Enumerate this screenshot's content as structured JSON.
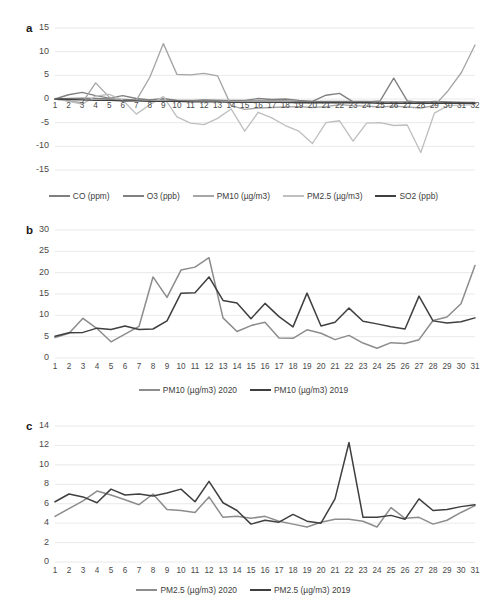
{
  "figure": {
    "width": 487,
    "height": 615,
    "background": "#ffffff"
  },
  "colors": {
    "co": "#7f7f7f",
    "o3": "#808080",
    "pm10": "#a6a6a6",
    "pm25": "#bfbfbf",
    "so2": "#404040",
    "series_2020": "#8c8c8c",
    "series_2019": "#3f3f3f",
    "gridline": "#e3e3e3",
    "text": "#404040"
  },
  "panels": {
    "a": {
      "letter": "a",
      "legend": [
        {
          "label": "CO (ppm)",
          "color": "#7f7f7f"
        },
        {
          "label": "O3 (ppb)",
          "color": "#808080"
        },
        {
          "label": "PM10 (µg/m3)",
          "color": "#a6a6a6"
        },
        {
          "label": "PM2.5 (µg/m3)",
          "color": "#bfbfbf"
        },
        {
          "label": "SO2 (ppb)",
          "color": "#404040"
        }
      ]
    },
    "b": {
      "letter": "b",
      "legend": [
        {
          "label": "PM10 (µg/m3) 2020",
          "color": "#8c8c8c"
        },
        {
          "label": "PM10 (µg/m3) 2019",
          "color": "#3f3f3f"
        }
      ]
    },
    "c": {
      "letter": "c",
      "legend": [
        {
          "label": "PM2.5 (µg/m3) 2020",
          "color": "#8c8c8c"
        },
        {
          "label": "PM2.5 (µg/m3) 2019",
          "color": "#3f3f3f"
        }
      ]
    }
  },
  "chart_data": [
    {
      "panel": "a",
      "type": "line",
      "title": "",
      "xlabel": "",
      "ylabel": "",
      "xlim": [
        1,
        32
      ],
      "ylim": [
        -15,
        15
      ],
      "yticks": [
        15,
        10,
        5,
        0,
        -5,
        -10,
        -15
      ],
      "xticks": [
        1,
        2,
        3,
        4,
        5,
        6,
        7,
        8,
        9,
        10,
        11,
        12,
        13,
        14,
        15,
        16,
        17,
        18,
        19,
        20,
        21,
        22,
        23,
        24,
        25,
        26,
        27,
        28,
        29,
        30,
        31,
        32
      ],
      "grid": true,
      "legend_position": "bottom",
      "x": [
        1,
        2,
        3,
        4,
        5,
        6,
        7,
        8,
        9,
        10,
        11,
        12,
        13,
        14,
        15,
        16,
        17,
        18,
        19,
        20,
        21,
        22,
        23,
        24,
        25,
        26,
        27,
        28,
        29,
        30,
        31,
        32
      ],
      "series": [
        {
          "name": "CO (ppm)",
          "color": "#7f7f7f",
          "values": [
            0.0,
            0.1,
            0.2,
            0.1,
            0.0,
            -0.1,
            -0.2,
            -0.2,
            -0.2,
            -0.3,
            -0.3,
            -0.3,
            -0.3,
            -0.4,
            -0.4,
            -0.4,
            -0.4,
            -0.4,
            -0.5,
            -0.5,
            -0.5,
            -0.5,
            -0.5,
            -0.5,
            -0.6,
            -0.6,
            -0.6,
            -0.6,
            -0.6,
            -0.7,
            -0.7,
            -0.7
          ]
        },
        {
          "name": "O3 (ppb)",
          "color": "#808080",
          "values": [
            0.0,
            0.9,
            1.4,
            0.7,
            0.2,
            0.7,
            0.1,
            -0.2,
            0.1,
            -0.3,
            -0.4,
            -0.2,
            -0.3,
            -0.3,
            -0.3,
            0.1,
            -0.1,
            0.0,
            -0.3,
            -0.5,
            0.8,
            1.2,
            -0.6,
            -0.6,
            -0.4,
            4.4,
            -0.4,
            -0.7,
            -0.5,
            -0.6,
            -0.7,
            -0.8
          ]
        },
        {
          "name": "PM10 (µg/m3)",
          "color": "#a6a6a6",
          "values": [
            0.0,
            -0.4,
            -0.8,
            3.4,
            0.4,
            -0.5,
            -0.3,
            4.6,
            11.7,
            5.2,
            5.1,
            5.4,
            4.9,
            -1.4,
            -2.2,
            -1.9,
            -1.8,
            -1.7,
            -1.6,
            -1.8,
            -1.6,
            -1.2,
            -1.4,
            -1.5,
            -1.7,
            -1.5,
            -1.7,
            -1.9,
            -1.4,
            1.7,
            5.6,
            11.4
          ]
        },
        {
          "name": "PM2.5 (µg/m3)",
          "color": "#bfbfbf",
          "values": [
            0.0,
            -0.5,
            -1.1,
            0.6,
            1.0,
            -0.2,
            -3.2,
            -1.2,
            0.5,
            -3.8,
            -5.1,
            -5.4,
            -4.1,
            -2.1,
            -6.8,
            -2.8,
            -4.0,
            -5.6,
            -6.8,
            -9.4,
            -5.0,
            -4.6,
            -8.9,
            -5.1,
            -5.0,
            -5.6,
            -5.5,
            -11.3,
            -3.0,
            -1.4,
            -1.3,
            -1.2
          ]
        },
        {
          "name": "SO2 (ppb)",
          "color": "#404040",
          "values": [
            0.0,
            -0.1,
            -0.2,
            -0.3,
            -0.3,
            -0.4,
            -0.4,
            -0.5,
            -0.5,
            -0.5,
            -0.6,
            -0.6,
            -0.6,
            -0.7,
            -0.7,
            -0.7,
            -0.7,
            -0.7,
            -0.8,
            -0.8,
            -0.8,
            -0.8,
            -0.8,
            -0.8,
            -0.9,
            -0.9,
            -0.9,
            -0.9,
            -0.9,
            -0.9,
            -0.9,
            -0.9
          ]
        }
      ]
    },
    {
      "panel": "b",
      "type": "line",
      "title": "",
      "xlabel": "",
      "ylabel": "",
      "xlim": [
        1,
        31
      ],
      "ylim": [
        0,
        30
      ],
      "yticks": [
        30,
        25,
        20,
        15,
        10,
        5,
        0
      ],
      "xticks": [
        1,
        2,
        3,
        4,
        5,
        6,
        7,
        8,
        9,
        10,
        11,
        12,
        13,
        14,
        15,
        16,
        17,
        18,
        19,
        20,
        21,
        22,
        23,
        24,
        25,
        26,
        27,
        28,
        29,
        30,
        31
      ],
      "grid": true,
      "legend_position": "bottom",
      "x": [
        1,
        2,
        3,
        4,
        5,
        6,
        7,
        8,
        9,
        10,
        11,
        12,
        13,
        14,
        15,
        16,
        17,
        18,
        19,
        20,
        21,
        22,
        23,
        24,
        25,
        26,
        27,
        28,
        29,
        30,
        31
      ],
      "series": [
        {
          "name": "PM10 (µg/m3) 2020",
          "color": "#8c8c8c",
          "values": [
            4.8,
            5.8,
            9.3,
            6.9,
            3.8,
            5.6,
            7.4,
            19.0,
            14.2,
            20.6,
            21.3,
            23.5,
            9.4,
            6.2,
            7.6,
            8.4,
            4.7,
            4.6,
            6.6,
            5.8,
            4.3,
            5.3,
            3.5,
            2.3,
            3.6,
            3.4,
            4.3,
            8.8,
            9.6,
            12.7,
            21.7
          ]
        },
        {
          "name": "PM10 (µg/m3) 2019",
          "color": "#3f3f3f",
          "values": [
            5.1,
            5.9,
            6.0,
            7.0,
            6.7,
            7.5,
            6.7,
            6.8,
            8.7,
            15.2,
            15.3,
            19.0,
            13.5,
            12.9,
            9.2,
            12.8,
            9.7,
            7.3,
            15.2,
            7.5,
            8.4,
            11.7,
            8.6,
            8.0,
            7.3,
            6.8,
            14.5,
            8.7,
            8.2,
            8.5,
            9.4
          ]
        }
      ]
    },
    {
      "panel": "c",
      "type": "line",
      "title": "",
      "xlabel": "",
      "ylabel": "",
      "xlim": [
        1,
        31
      ],
      "ylim": [
        0,
        14
      ],
      "yticks": [
        14,
        12,
        10,
        8,
        6,
        4,
        2,
        0
      ],
      "xticks": [
        1,
        2,
        3,
        4,
        5,
        6,
        7,
        8,
        9,
        10,
        11,
        12,
        13,
        14,
        15,
        16,
        17,
        18,
        19,
        20,
        21,
        22,
        23,
        24,
        25,
        26,
        27,
        28,
        29,
        30,
        31
      ],
      "grid": true,
      "legend_position": "bottom",
      "x": [
        1,
        2,
        3,
        4,
        5,
        6,
        7,
        8,
        9,
        10,
        11,
        12,
        13,
        14,
        15,
        16,
        17,
        18,
        19,
        20,
        21,
        22,
        23,
        24,
        25,
        26,
        27,
        28,
        29,
        30,
        31
      ],
      "series": [
        {
          "name": "PM2.5 (µg/m3) 2020",
          "color": "#8c8c8c",
          "values": [
            4.7,
            5.5,
            6.3,
            7.3,
            6.9,
            6.4,
            5.9,
            7.0,
            5.4,
            5.3,
            5.1,
            6.7,
            4.6,
            4.7,
            4.5,
            4.7,
            4.2,
            3.9,
            3.6,
            4.1,
            4.4,
            4.4,
            4.2,
            3.6,
            5.6,
            4.5,
            4.6,
            3.9,
            4.3,
            5.1,
            5.8
          ]
        },
        {
          "name": "PM2.5 (µg/m3) 2019",
          "color": "#3f3f3f",
          "values": [
            6.2,
            7.0,
            6.7,
            6.1,
            7.5,
            6.9,
            7.0,
            6.8,
            7.1,
            7.5,
            6.2,
            8.3,
            6.1,
            5.3,
            3.9,
            4.3,
            4.1,
            4.9,
            4.2,
            4.0,
            6.5,
            12.3,
            4.6,
            4.6,
            4.8,
            4.4,
            6.5,
            5.3,
            5.4,
            5.7,
            5.9
          ]
        }
      ]
    }
  ]
}
